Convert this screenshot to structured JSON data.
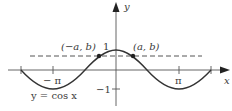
{
  "diagram": {
    "type": "function-graph",
    "axes": {
      "x_label": "x",
      "y_label": "y"
    },
    "ticks": {
      "x": [
        "−π",
        "π"
      ],
      "y": [
        "1",
        "−1"
      ]
    },
    "curve_label": "y = cos x",
    "points": [
      {
        "label": "(−a, b)"
      },
      {
        "label": "(a, b)"
      }
    ],
    "dashed_line": "y = b",
    "colors": {
      "curve": "#333333",
      "axes": "#555555",
      "dashed": "#555555"
    }
  },
  "labels": {
    "x_axis": "x",
    "y_axis": "y",
    "neg_pi": "− π",
    "pi": "π",
    "one": "1",
    "neg_one": "−1",
    "point_left": "(−a, b)",
    "point_right": "(a, b)",
    "curve": "y = cos x"
  }
}
